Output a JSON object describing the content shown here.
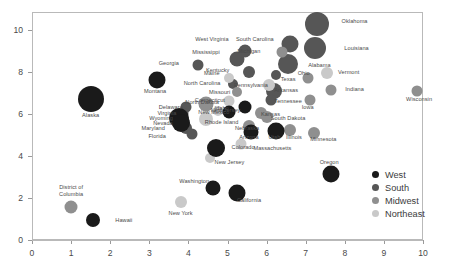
{
  "chart_data": {
    "type": "scatter",
    "title": "",
    "xlabel": "",
    "ylabel": "",
    "xlim": [
      0,
      10.5
    ],
    "ylim": [
      0,
      10.8
    ],
    "xticks": [
      0,
      1,
      2,
      3,
      4,
      5,
      6,
      7,
      8,
      9,
      10
    ],
    "yticks": [
      0,
      2,
      4,
      6,
      8,
      10
    ],
    "grid": false,
    "legend_position": "bottom-right",
    "bubble_note": "marker area encodes a third magnitude variable",
    "legend": [
      {
        "label": "West",
        "color": "#1a1a1a"
      },
      {
        "label": "South",
        "color": "#565656"
      },
      {
        "label": "Midwest",
        "color": "#8f8f8f"
      },
      {
        "label": "Northeast",
        "color": "#c9c9c9"
      }
    ],
    "series": [
      {
        "name": "West",
        "color": "#1a1a1a"
      },
      {
        "name": "South",
        "color": "#565656"
      },
      {
        "name": "Midwest",
        "color": "#8f8f8f"
      },
      {
        "name": "Northeast",
        "color": "#c9c9c9"
      }
    ],
    "points": [
      {
        "label": "Oklahoma",
        "group": "South",
        "x": 7.3,
        "y": 10.3,
        "size": 24,
        "lx": 8.25,
        "ly": 10.45
      },
      {
        "label": "South Carolina",
        "group": "South",
        "x": 6.6,
        "y": 9.35,
        "size": 17,
        "lx": 5.7,
        "ly": 9.55
      },
      {
        "label": "Louisiana",
        "group": "South",
        "x": 7.25,
        "y": 9.15,
        "size": 22,
        "lx": 8.3,
        "ly": 9.15
      },
      {
        "label": "Michigan",
        "group": "Midwest",
        "x": 6.4,
        "y": 8.95,
        "size": 11,
        "lx": 5.55,
        "ly": 9.0
      },
      {
        "label": "West Virginia",
        "group": "South",
        "x": 5.45,
        "y": 9.0,
        "size": 13,
        "lx": 4.6,
        "ly": 9.55
      },
      {
        "label": "Alabama",
        "group": "South",
        "x": 6.55,
        "y": 8.4,
        "size": 20,
        "lx": 7.35,
        "ly": 8.35
      },
      {
        "label": "Mississippi",
        "group": "South",
        "x": 5.25,
        "y": 8.6,
        "size": 15,
        "lx": 4.45,
        "ly": 8.95
      },
      {
        "label": "Georgia",
        "group": "South",
        "x": 4.25,
        "y": 8.35,
        "size": 11,
        "lx": 3.5,
        "ly": 8.45
      },
      {
        "label": "Kentucky",
        "group": "South",
        "x": 5.55,
        "y": 8.0,
        "size": 12,
        "lx": 4.75,
        "ly": 8.1
      },
      {
        "label": "Texas",
        "group": "South",
        "x": 6.25,
        "y": 7.85,
        "size": 10,
        "lx": 6.55,
        "ly": 7.65
      },
      {
        "label": "Ohio",
        "group": "Midwest",
        "x": 7.05,
        "y": 7.7,
        "size": 11,
        "lx": 6.95,
        "ly": 7.95
      },
      {
        "label": "Vermont",
        "group": "Northeast",
        "x": 7.55,
        "y": 7.95,
        "size": 12,
        "lx": 8.1,
        "ly": 8.0
      },
      {
        "label": "Maine",
        "group": "Northeast",
        "x": 5.05,
        "y": 7.7,
        "size": 10,
        "lx": 4.6,
        "ly": 7.95
      },
      {
        "label": "North Carolina",
        "group": "South",
        "x": 5.15,
        "y": 7.45,
        "size": 10,
        "lx": 4.35,
        "ly": 7.5
      },
      {
        "label": "Montana",
        "group": "West",
        "x": 3.2,
        "y": 7.6,
        "size": 17,
        "lx": 3.15,
        "ly": 7.1
      },
      {
        "label": "Pennsylvania",
        "group": "Northeast",
        "x": 6.05,
        "y": 7.4,
        "size": 12,
        "lx": 5.6,
        "ly": 7.4
      },
      {
        "label": "Arkansas",
        "group": "South",
        "x": 6.2,
        "y": 7.1,
        "size": 16,
        "lx": 6.5,
        "ly": 7.15
      },
      {
        "label": "Indiana",
        "group": "Midwest",
        "x": 7.65,
        "y": 7.15,
        "size": 11,
        "lx": 8.25,
        "ly": 7.2
      },
      {
        "label": "Wisconsin",
        "group": "Midwest",
        "x": 9.85,
        "y": 7.1,
        "size": 11,
        "lx": 9.9,
        "ly": 6.7
      },
      {
        "label": "Missouri",
        "group": "Midwest",
        "x": 5.25,
        "y": 7.05,
        "size": 10,
        "lx": 4.8,
        "ly": 7.05
      },
      {
        "label": "Connecticut",
        "group": "Northeast",
        "x": 5.05,
        "y": 6.6,
        "size": 11,
        "lx": 4.55,
        "ly": 6.65
      },
      {
        "label": "Tennessee",
        "group": "South",
        "x": 6.1,
        "y": 6.65,
        "size": 11,
        "lx": 6.55,
        "ly": 6.6
      },
      {
        "label": "Iowa",
        "group": "Midwest",
        "x": 7.1,
        "y": 6.65,
        "size": 11,
        "lx": 7.05,
        "ly": 6.35
      },
      {
        "label": "North Dakota",
        "group": "Midwest",
        "x": 4.45,
        "y": 6.5,
        "size": 15,
        "lx": 4.35,
        "ly": 6.55
      },
      {
        "label": "Idaho",
        "group": "West",
        "x": 5.45,
        "y": 6.35,
        "size": 13,
        "lx": 4.85,
        "ly": 6.3
      },
      {
        "label": "Delaware",
        "group": "South",
        "x": 3.95,
        "y": 6.35,
        "size": 11,
        "lx": 3.55,
        "ly": 6.35
      },
      {
        "label": "New Mexico",
        "group": "West",
        "x": 5.05,
        "y": 6.1,
        "size": 13,
        "lx": 4.65,
        "ly": 6.1
      },
      {
        "label": "New Jersey",
        "group": "Northeast",
        "x": 4.75,
        "y": 6.15,
        "size": 10,
        "lx": 4.95,
        "ly": 6.2
      },
      {
        "label": "Virginia",
        "group": "South",
        "x": 3.85,
        "y": 6.05,
        "size": 11,
        "lx": 3.45,
        "ly": 6.05
      },
      {
        "label": "Kansas",
        "group": "Midwest",
        "x": 5.85,
        "y": 6.05,
        "size": 12,
        "lx": 6.1,
        "ly": 6.0
      },
      {
        "label": "Wyoming",
        "group": "West",
        "x": 3.75,
        "y": 5.8,
        "size": 20,
        "lx": 3.3,
        "ly": 5.8
      },
      {
        "label": "Rhode Island",
        "group": "Northeast",
        "x": 4.45,
        "y": 5.75,
        "size": 14,
        "lx": 4.85,
        "ly": 5.6
      },
      {
        "label": "Nevada",
        "group": "West",
        "x": 3.8,
        "y": 5.55,
        "size": 18,
        "lx": 3.35,
        "ly": 5.55
      },
      {
        "label": "Nebraska",
        "group": "Midwest",
        "x": 5.55,
        "y": 5.45,
        "size": 12,
        "lx": 5.5,
        "ly": 5.35
      },
      {
        "label": "Alaska",
        "group": "West",
        "x": 1.5,
        "y": 6.7,
        "size": 26,
        "lx": 1.5,
        "ly": 5.95
      },
      {
        "label": "Maryland",
        "group": "South",
        "x": 3.95,
        "y": 5.35,
        "size": 12,
        "lx": 3.1,
        "ly": 5.35
      },
      {
        "label": "Arizona",
        "group": "West",
        "x": 5.6,
        "y": 5.15,
        "size": 15,
        "lx": 5.55,
        "ly": 4.9
      },
      {
        "label": "Utah",
        "group": "West",
        "x": 6.25,
        "y": 5.2,
        "size": 17,
        "lx": 6.2,
        "ly": 4.9
      },
      {
        "label": "Illinois",
        "group": "Midwest",
        "x": 6.6,
        "y": 5.25,
        "size": 12,
        "lx": 6.7,
        "ly": 4.9
      },
      {
        "label": "South Dakota",
        "group": "Midwest",
        "x": 6.0,
        "y": 5.85,
        "size": 12,
        "lx": 6.55,
        "ly": 5.8
      },
      {
        "label": "Minnesota",
        "group": "Midwest",
        "x": 7.2,
        "y": 5.1,
        "size": 12,
        "lx": 7.45,
        "ly": 4.8
      },
      {
        "label": "Florida",
        "group": "South",
        "x": 4.1,
        "y": 5.05,
        "size": 11,
        "lx": 3.2,
        "ly": 4.95
      },
      {
        "label": "Colorado",
        "group": "West",
        "x": 4.7,
        "y": 4.4,
        "size": 18,
        "lx": 5.4,
        "ly": 4.45
      },
      {
        "label": "Massachusetts",
        "group": "Northeast",
        "x": 5.35,
        "y": 4.55,
        "size": 11,
        "lx": 6.15,
        "ly": 4.4
      },
      {
        "label": "New Jersey 2",
        "group": "Northeast",
        "x": 4.55,
        "y": 3.9,
        "size": 10,
        "lx": 5.05,
        "ly": 3.7
      },
      {
        "label": "Oregon",
        "group": "West",
        "x": 7.65,
        "y": 3.15,
        "size": 17,
        "lx": 7.6,
        "ly": 3.7
      },
      {
        "label": "Washington",
        "group": "West",
        "x": 4.63,
        "y": 2.5,
        "size": 15,
        "lx": 4.15,
        "ly": 2.8
      },
      {
        "label": "California",
        "group": "West",
        "x": 5.25,
        "y": 2.25,
        "size": 17,
        "lx": 5.55,
        "ly": 1.9
      },
      {
        "label": "New York",
        "group": "Northeast",
        "x": 3.8,
        "y": 1.8,
        "size": 12,
        "lx": 3.8,
        "ly": 1.3
      },
      {
        "label": "District of Columbia",
        "group": "Midwest",
        "x": 1.0,
        "y": 1.55,
        "size": 13,
        "lx": 1.0,
        "ly": 2.35
      },
      {
        "label": "Hawaii",
        "group": "West",
        "x": 1.55,
        "y": 0.95,
        "size": 14,
        "lx": 2.35,
        "ly": 0.95
      }
    ]
  }
}
